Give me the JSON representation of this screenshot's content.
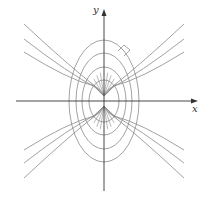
{
  "figure": {
    "width": 210,
    "height": 203,
    "origin": [
      104,
      101
    ],
    "colors": {
      "axis": "#333333",
      "curve": "#8a8a8a",
      "background": "#ffffff"
    }
  },
  "axes": {
    "x_label": "x",
    "y_label": "y",
    "x_axis": {
      "from": [
        16,
        101
      ],
      "to": [
        198,
        101
      ]
    },
    "y_axis": {
      "from": [
        104,
        191
      ],
      "to": [
        104,
        9
      ]
    }
  },
  "ellipses": [
    {
      "rx": 15,
      "ry": 21
    },
    {
      "rx": 22,
      "ry": 34
    },
    {
      "rx": 28,
      "ry": 48
    },
    {
      "rx": 35,
      "ry": 61
    }
  ],
  "foci": [
    [
      104,
      96
    ],
    [
      104,
      106
    ]
  ],
  "hyperbola_ends_y_top": [
    24,
    39,
    52
  ],
  "hyperbola_ends_y_bottom": [
    178,
    163,
    150
  ],
  "hyperbola_end_x": {
    "left": 24,
    "right": 184
  },
  "inner_ray_angles_deg": [
    30,
    45,
    60,
    75
  ],
  "right_angle_marker": {
    "points": [
      [
        118,
        51
      ],
      [
        124,
        45
      ],
      [
        130,
        50
      ],
      [
        124,
        56
      ]
    ]
  }
}
